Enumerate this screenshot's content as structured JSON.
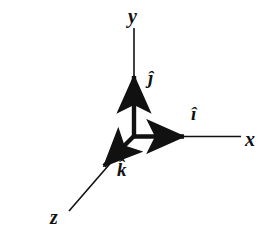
{
  "figure": {
    "background_color": "#ffffff",
    "ink_color": "#111111",
    "width": 272,
    "height": 240,
    "origin": {
      "x": 134,
      "y": 136
    }
  },
  "axes": [
    {
      "id": "x",
      "label": "x",
      "label_position": {
        "x": 245,
        "y": 129
      },
      "direction": "right",
      "thin_line": {
        "x1": 134,
        "y1": 136,
        "x2": 241,
        "y2": 136
      }
    },
    {
      "id": "y",
      "label": "y",
      "label_position": {
        "x": 128,
        "y": 6
      },
      "direction": "up",
      "thin_line": {
        "x1": 134,
        "y1": 136,
        "x2": 134,
        "y2": 29
      }
    },
    {
      "id": "z",
      "label": "z",
      "label_position": {
        "x": 50,
        "y": 207
      },
      "direction": "down-left",
      "thin_line": {
        "x1": 134,
        "y1": 136,
        "x2": 69,
        "y2": 211
      }
    }
  ],
  "unit_vectors": [
    {
      "id": "ihat",
      "label": "i",
      "hat": "^",
      "along_axis": "x",
      "label_position": {
        "x": 191,
        "y": 104
      },
      "arrow": {
        "x1": 134,
        "y1": 136,
        "x2": 190,
        "y2": 136
      }
    },
    {
      "id": "jhat",
      "label": "j",
      "hat": "^",
      "along_axis": "y",
      "label_position": {
        "x": 148,
        "y": 68
      },
      "arrow": {
        "x1": 134,
        "y1": 136,
        "x2": 134,
        "y2": 70
      }
    },
    {
      "id": "khat",
      "label": "k",
      "hat": "^",
      "along_axis": "z",
      "label_position": {
        "x": 117,
        "y": 160
      },
      "arrow": {
        "x1": 134,
        "y1": 136,
        "x2": 98,
        "y2": 172
      }
    }
  ]
}
